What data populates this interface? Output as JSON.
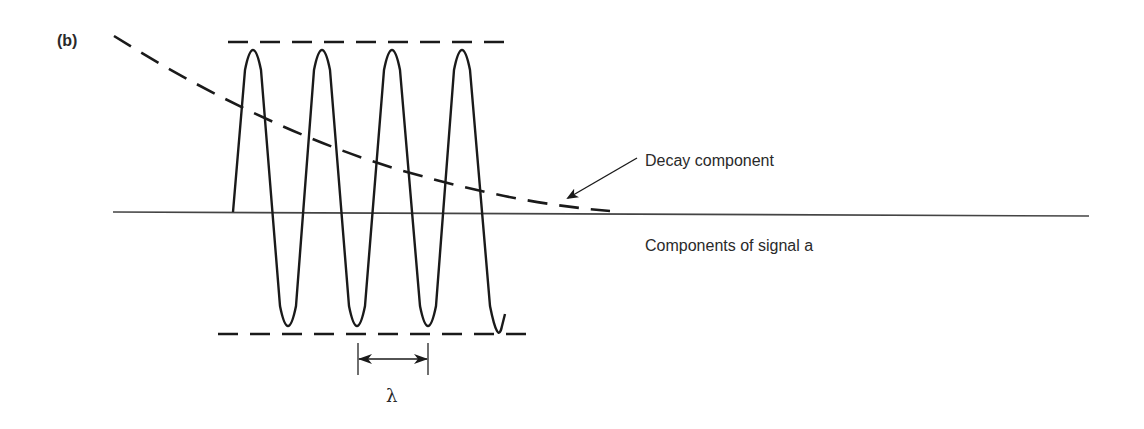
{
  "figure": {
    "panel_label": "(b)",
    "annotations": {
      "decay": "Decay component",
      "signal": "Components of signal a",
      "wavelength_symbol": "λ"
    },
    "colors": {
      "line": "#1a1a1a",
      "baseline": "#444444",
      "background": "#ffffff"
    },
    "elements": [
      {
        "name": "baseline",
        "type": "solid-line"
      },
      {
        "name": "oscillation",
        "type": "sine-wave",
        "peaks": 4,
        "troughs": 4
      },
      {
        "name": "upper-envelope",
        "type": "dashed-line"
      },
      {
        "name": "lower-envelope",
        "type": "dashed-line"
      },
      {
        "name": "decay-curve",
        "type": "dashed-curve"
      },
      {
        "name": "decay-pointer",
        "type": "arrow"
      },
      {
        "name": "wavelength-marker",
        "type": "double-arrow"
      }
    ]
  }
}
